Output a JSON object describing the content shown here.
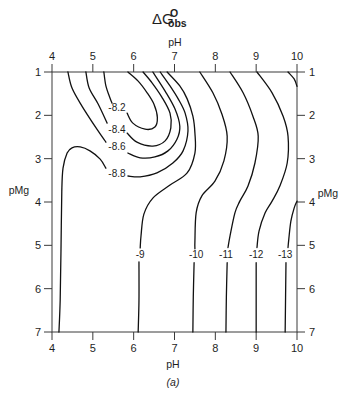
{
  "figure": {
    "title_main": "ΔG",
    "title_sup": "O",
    "title_sub": "obs",
    "caption": "(a)"
  },
  "chart_data": {
    "type": "contour",
    "xlabel": "pH",
    "ylabel": "pMg",
    "xlim": [
      4,
      10
    ],
    "ylim": [
      1,
      7
    ],
    "y_inverted": true,
    "axes_on_all_sides": true,
    "grid": false,
    "xticks": [
      4,
      5,
      6,
      7,
      8,
      9,
      10
    ],
    "xtick_labels": [
      "4",
      "5",
      "6",
      "7",
      "8",
      "9",
      "10"
    ],
    "yticks": [
      1,
      2,
      3,
      4,
      5,
      6,
      7
    ],
    "ytick_labels": [
      "1",
      "2",
      "3",
      "4",
      "5",
      "6",
      "7"
    ],
    "contours": [
      {
        "level": -8.2,
        "label": "-8.2",
        "label_pos": [
          5.59,
          1.83
        ],
        "segments": [
          [
            [
              5.27,
              1.0
            ],
            [
              5.32,
              1.32
            ],
            [
              5.42,
              1.6
            ],
            [
              5.47,
              1.72
            ]
          ],
          [
            [
              5.84,
              1.95
            ],
            [
              5.98,
              2.18
            ],
            [
              6.28,
              2.32
            ],
            [
              6.52,
              2.27
            ],
            [
              6.58,
              2.05
            ],
            [
              6.5,
              1.75
            ],
            [
              6.33,
              1.48
            ],
            [
              6.11,
              1.21
            ],
            [
              5.86,
              1.0
            ]
          ]
        ]
      },
      {
        "level": -8.4,
        "label": "-8.4",
        "label_pos": [
          5.59,
          2.32
        ],
        "segments": [
          [
            [
              4.83,
              1.0
            ],
            [
              4.91,
              1.37
            ],
            [
              5.13,
              1.74
            ],
            [
              5.35,
              2.18
            ]
          ],
          [
            [
              5.84,
              2.41
            ],
            [
              6.08,
              2.62
            ],
            [
              6.47,
              2.71
            ],
            [
              6.77,
              2.59
            ],
            [
              6.91,
              2.29
            ],
            [
              6.89,
              1.95
            ],
            [
              6.69,
              1.58
            ],
            [
              6.45,
              1.25
            ],
            [
              6.23,
              1.0
            ]
          ]
        ]
      },
      {
        "level": -8.6,
        "label": "-8.6",
        "label_pos": [
          5.59,
          2.73
        ],
        "segments": [
          [
            [
              4.39,
              1.0
            ],
            [
              4.49,
              1.37
            ],
            [
              4.73,
              1.78
            ],
            [
              5.1,
              2.32
            ],
            [
              5.32,
              2.62
            ]
          ],
          [
            [
              5.86,
              2.87
            ],
            [
              6.16,
              2.98
            ],
            [
              6.52,
              2.96
            ],
            [
              6.84,
              2.82
            ],
            [
              7.06,
              2.55
            ],
            [
              7.13,
              2.25
            ],
            [
              7.01,
              1.85
            ],
            [
              6.77,
              1.44
            ],
            [
              6.47,
              1.0
            ]
          ]
        ]
      },
      {
        "level": -8.8,
        "label": "-8.8",
        "label_pos": [
          5.59,
          3.35
        ],
        "segments": [
          [
            [
              4.17,
              7.0
            ],
            [
              4.2,
              6.28
            ],
            [
              4.22,
              5.13
            ],
            [
              4.24,
              3.75
            ],
            [
              4.27,
              3.22
            ],
            [
              4.37,
              2.87
            ],
            [
              4.49,
              2.75
            ],
            [
              4.69,
              2.73
            ],
            [
              4.93,
              2.82
            ],
            [
              5.18,
              3.01
            ],
            [
              5.32,
              3.22
            ]
          ],
          [
            [
              5.86,
              3.4
            ],
            [
              6.16,
              3.42
            ],
            [
              6.57,
              3.33
            ],
            [
              6.96,
              3.1
            ],
            [
              7.21,
              2.82
            ],
            [
              7.33,
              2.36
            ],
            [
              7.26,
              1.95
            ],
            [
              7.09,
              1.62
            ],
            [
              6.89,
              1.32
            ],
            [
              6.65,
              1.0
            ]
          ]
        ]
      },
      {
        "level": -9,
        "label": "-9",
        "label_pos": [
          6.16,
          5.22
        ],
        "segments": [
          [
            [
              6.82,
              1.0
            ],
            [
              7.13,
              1.32
            ],
            [
              7.31,
              1.62
            ],
            [
              7.45,
              2.02
            ],
            [
              7.5,
              2.41
            ],
            [
              7.5,
              2.87
            ],
            [
              7.31,
              3.33
            ],
            [
              6.89,
              3.61
            ],
            [
              6.47,
              3.91
            ],
            [
              6.25,
              4.28
            ],
            [
              6.18,
              4.78
            ],
            [
              6.16,
              5.06
            ]
          ],
          [
            [
              6.13,
              5.38
            ],
            [
              6.13,
              6.28
            ],
            [
              6.11,
              7.0
            ]
          ]
        ]
      },
      {
        "level": -10,
        "label": "-10",
        "label_pos": [
          7.53,
          5.22
        ],
        "segments": [
          [
            [
              7.62,
              1.0
            ],
            [
              7.94,
              1.48
            ],
            [
              8.16,
              1.97
            ],
            [
              8.29,
              2.48
            ],
            [
              8.21,
              3.05
            ],
            [
              7.99,
              3.52
            ],
            [
              7.67,
              3.86
            ],
            [
              7.53,
              4.25
            ],
            [
              7.5,
              4.9
            ],
            [
              7.5,
              5.08
            ]
          ],
          [
            [
              7.48,
              5.4
            ],
            [
              7.46,
              6.2
            ],
            [
              7.45,
              7.0
            ]
          ]
        ]
      },
      {
        "level": -11,
        "label": "-11",
        "label_pos": [
          8.26,
          5.22
        ],
        "segments": [
          [
            [
              8.36,
              1.0
            ],
            [
              8.68,
              1.48
            ],
            [
              8.92,
              2.02
            ],
            [
              9.05,
              2.48
            ],
            [
              8.97,
              3.1
            ],
            [
              8.8,
              3.63
            ],
            [
              8.6,
              3.98
            ],
            [
              8.48,
              4.25
            ],
            [
              8.36,
              4.78
            ],
            [
              8.31,
              5.05
            ]
          ],
          [
            [
              8.29,
              5.4
            ],
            [
              8.27,
              6.2
            ],
            [
              8.26,
              7.0
            ]
          ]
        ]
      },
      {
        "level": -12,
        "label": "-12",
        "label_pos": [
          9.0,
          5.22
        ],
        "segments": [
          [
            [
              9.02,
              1.0
            ],
            [
              9.39,
              1.48
            ],
            [
              9.66,
              2.02
            ],
            [
              9.78,
              2.48
            ],
            [
              9.76,
              3.1
            ],
            [
              9.58,
              3.63
            ],
            [
              9.39,
              3.98
            ],
            [
              9.22,
              4.25
            ],
            [
              9.07,
              4.67
            ],
            [
              9.02,
              5.05
            ]
          ],
          [
            [
              9.0,
              5.4
            ],
            [
              9.0,
              6.2
            ],
            [
              9.0,
              7.0
            ]
          ]
        ]
      },
      {
        "level": -13,
        "label": "-13",
        "label_pos": [
          9.71,
          5.22
        ],
        "segments": [
          [
            [
              10.0,
              3.98
            ],
            [
              9.93,
              4.14
            ],
            [
              9.85,
              4.44
            ],
            [
              9.8,
              4.85
            ],
            [
              9.78,
              5.05
            ]
          ],
          [
            [
              9.73,
              5.4
            ],
            [
              9.72,
              6.2
            ],
            [
              9.71,
              7.0
            ]
          ],
          [
            [
              9.78,
              1.0
            ],
            [
              9.93,
              1.16
            ],
            [
              10.0,
              1.33
            ]
          ]
        ]
      }
    ]
  }
}
